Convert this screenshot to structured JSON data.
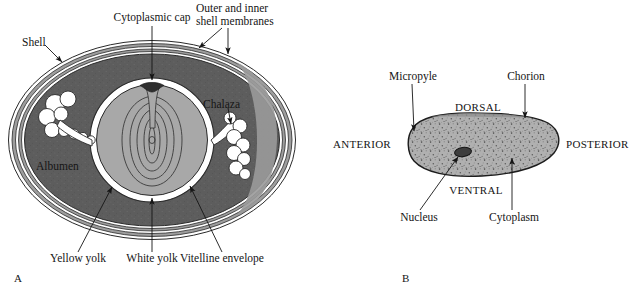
{
  "figure": {
    "type": "scientific-diagram",
    "panels": [
      {
        "id": "A",
        "panel_label": "A",
        "subject": "Bird (hen) egg — sagittal section",
        "labels": {
          "shell": "Shell",
          "cytoplasmic_cap": "Cytoplasmic cap",
          "shell_membranes_line1": "Outer and inner",
          "shell_membranes_line2": "shell membranes",
          "chalaza": "Chalaza",
          "albumen": "Albumen",
          "yellow_yolk": "Yellow yolk",
          "white_yolk": "White yolk",
          "vitelline_envelope": "Vitelline envelope"
        }
      },
      {
        "id": "B",
        "panel_label": "B",
        "subject": "Insect egg — lateral view",
        "labels": {
          "micropyle": "Micropyle",
          "chorion": "Chorion",
          "dorsal": "DORSAL",
          "ventral": "VENTRAL",
          "anterior": "ANTERIOR",
          "posterior": "POSTERIOR",
          "nucleus": "Nucleus",
          "cytoplasm": "Cytoplasm"
        }
      }
    ]
  },
  "colors": {
    "background": "#ffffff",
    "ink": "#151515",
    "albumen_gray": "#5d5d5d",
    "yolk_gray": "#a8a8a8",
    "vitelline_white": "#ffffff",
    "shell_gray": "#9d9d9d",
    "insect_egg_gray": "#a9a9a9",
    "nucleus_dark": "#3a3a3a"
  }
}
